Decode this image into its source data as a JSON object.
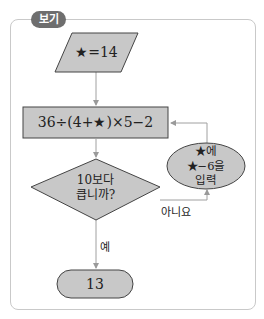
{
  "badge": {
    "label": "보기"
  },
  "flowchart": {
    "input": {
      "label": "★=14"
    },
    "process": {
      "label": "36÷(4+★)×5−2"
    },
    "decision": {
      "line1": "10보다",
      "line2": "큽니까?"
    },
    "update": {
      "line1": "★에",
      "line2": "★−6을",
      "line3": "입력"
    },
    "yes_label": "예",
    "no_label": "아니요",
    "output": {
      "label": "13"
    }
  },
  "colors": {
    "shape_fill": "#c8c8c8",
    "stroke": "#444444",
    "arrow": "#9a9a9a",
    "frame": "#c9c9c9",
    "badge": "#6e6e6e"
  }
}
